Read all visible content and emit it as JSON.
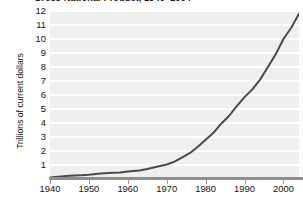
{
  "figure": {
    "title": "Gross National Product, 1940–2004",
    "background_color": "#ffffff",
    "plot_background_color": "#efeff0",
    "gridline_color": "#ffffff",
    "line_color": "#4a4a4a",
    "axis_color": "#8e8e90"
  },
  "chart_data": {
    "type": "line",
    "title": "Gross National Product, 1940–2004",
    "xlabel": "",
    "ylabel": "Trillions of current dollars",
    "xlim": [
      1940,
      2004
    ],
    "ylim": [
      0,
      12
    ],
    "grid": "horizontal",
    "legend": "none",
    "x_ticks": [
      1940,
      1950,
      1960,
      1970,
      1980,
      1990,
      2000
    ],
    "y_ticks": [
      1,
      2,
      3,
      4,
      5,
      6,
      7,
      8,
      9,
      10,
      11,
      12
    ],
    "series": [
      {
        "name": "Gross National Product",
        "units": "trillions of current dollars",
        "x": [
          1940,
          1942,
          1945,
          1948,
          1950,
          1953,
          1955,
          1958,
          1960,
          1963,
          1965,
          1968,
          1970,
          1972,
          1974,
          1976,
          1978,
          1980,
          1982,
          1984,
          1986,
          1988,
          1990,
          1992,
          1994,
          1996,
          1998,
          2000,
          2002,
          2004
        ],
        "values": [
          0.1,
          0.16,
          0.23,
          0.27,
          0.3,
          0.39,
          0.43,
          0.47,
          0.53,
          0.61,
          0.72,
          0.91,
          1.04,
          1.24,
          1.55,
          1.86,
          2.3,
          2.8,
          3.3,
          3.95,
          4.5,
          5.2,
          5.85,
          6.4,
          7.1,
          8.0,
          8.9,
          10.0,
          10.8,
          11.8
        ]
      }
    ]
  },
  "axes": {
    "y_tick_labels": [
      "12",
      "11",
      "10",
      "9",
      "8",
      "7",
      "6",
      "5",
      "4",
      "3",
      "2",
      "1"
    ],
    "x_tick_labels": [
      "1940",
      "1950",
      "1960",
      "1970",
      "1980",
      "1990",
      "2000"
    ],
    "y_axis_title": "Trillions of current dollars"
  }
}
